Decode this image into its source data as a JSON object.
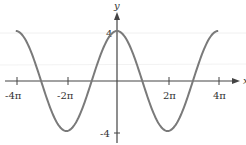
{
  "chart_data": {
    "type": "line",
    "title": "",
    "function": "y = 4cos(x/2)",
    "xlabel": "x",
    "ylabel": "y",
    "xlim": [
      -12.566,
      12.566
    ],
    "ylim": [
      -4,
      4
    ],
    "grid": false,
    "legend": null,
    "x_ticks": [
      {
        "value": -12.566,
        "label": "-4π"
      },
      {
        "value": -6.283,
        "label": "-2π"
      },
      {
        "value": 6.283,
        "label": "2π"
      },
      {
        "value": 12.566,
        "label": "4π"
      }
    ],
    "y_ticks": [
      {
        "value": 4,
        "label": "4"
      },
      {
        "value": -4,
        "label": "-4"
      }
    ],
    "series": [
      {
        "name": "4cos(x/2)",
        "color": "#7a7a7a",
        "x": [
          -12.566,
          -9.425,
          -6.283,
          -3.142,
          0,
          3.142,
          6.283,
          9.425,
          12.566
        ],
        "y": [
          4,
          0,
          -4,
          0,
          4,
          0,
          -4,
          0,
          4
        ]
      }
    ]
  },
  "colors": {
    "curve": "#7a7a7a",
    "axis": "#444444",
    "text": "#333333"
  },
  "labels": {
    "y_axis": "y",
    "x_axis": "x",
    "x_tick_m4pi": "-4π",
    "x_tick_m2pi": "-2π",
    "x_tick_2pi": "2π",
    "x_tick_4pi": "4π",
    "y_tick_4": "4",
    "y_tick_m4": "-4"
  }
}
